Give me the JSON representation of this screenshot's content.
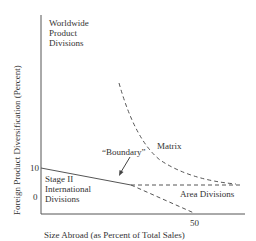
{
  "diagram": {
    "type": "stopford-wells-international-structure-model",
    "y_axis": {
      "label": "Foreign Product Diversification (Percent)",
      "ticks": [
        "10",
        "0"
      ]
    },
    "x_axis": {
      "label": "Size Abroad (as Percent of Total Sales)",
      "ticks": [
        "50"
      ]
    },
    "regions": [
      {
        "name": "worldwide-product-divisions",
        "lines": [
          "Worldwide",
          "Product",
          "Divisions"
        ]
      },
      {
        "name": "stage-ii-international-divisions",
        "lines": [
          "Stage II",
          "International",
          "Divisions"
        ]
      },
      {
        "name": "matrix",
        "lines": [
          "Matrix"
        ]
      },
      {
        "name": "area-divisions",
        "lines": [
          "Area Divisions"
        ]
      }
    ],
    "annotation": {
      "label": "“Boundary”"
    },
    "colors": {
      "line": "#555555",
      "text": "#333333",
      "background": "#ffffff"
    }
  }
}
